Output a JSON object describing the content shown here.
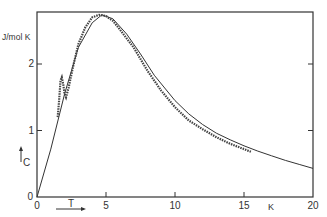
{
  "chart_data": {
    "type": "line",
    "title": "",
    "xlabel": "T",
    "xunit": "K",
    "ylabel": "C",
    "yunit": "J/mol K",
    "xlim": [
      0,
      20
    ],
    "ylim": [
      0,
      2.75
    ],
    "xticks": [
      0,
      5,
      10,
      15,
      20
    ],
    "xtick_labels": [
      "0",
      "5",
      "10",
      "15",
      "20"
    ],
    "yticks": [
      0,
      1,
      2
    ],
    "ytick_labels": [
      "0",
      "1",
      "2"
    ],
    "grid": false,
    "legend": null,
    "series": [
      {
        "name": "theoretical curve",
        "style": "solid-line",
        "x": [
          0,
          1,
          2,
          3,
          4,
          4.7,
          5.5,
          6.5,
          7.5,
          8.5,
          10,
          11,
          12,
          13,
          14,
          15,
          16,
          17,
          18,
          19,
          20
        ],
        "y": [
          0,
          0.72,
          1.55,
          2.25,
          2.62,
          2.74,
          2.68,
          2.45,
          2.15,
          1.83,
          1.45,
          1.25,
          1.09,
          0.96,
          0.86,
          0.77,
          0.69,
          0.62,
          0.55,
          0.49,
          0.43
        ]
      },
      {
        "name": "measured data",
        "style": "points",
        "x": [
          1.5,
          1.6,
          1.7,
          1.8,
          1.9,
          2.0,
          2.1,
          2.3,
          2.6,
          3.0,
          3.5,
          4.0,
          4.5,
          5.0,
          5.5,
          6.0,
          7.0,
          8.0,
          9.0,
          10.0,
          11.0,
          12.0,
          13.0,
          14.0,
          15.0,
          15.5
        ],
        "y": [
          1.2,
          1.45,
          1.75,
          1.8,
          1.7,
          1.55,
          1.5,
          1.65,
          1.95,
          2.3,
          2.55,
          2.7,
          2.74,
          2.72,
          2.65,
          2.52,
          2.25,
          1.9,
          1.6,
          1.35,
          1.15,
          1.02,
          0.9,
          0.8,
          0.72,
          0.68
        ]
      }
    ],
    "annotations": [
      "T →",
      "↑ C",
      "K",
      "J/mol K"
    ]
  }
}
